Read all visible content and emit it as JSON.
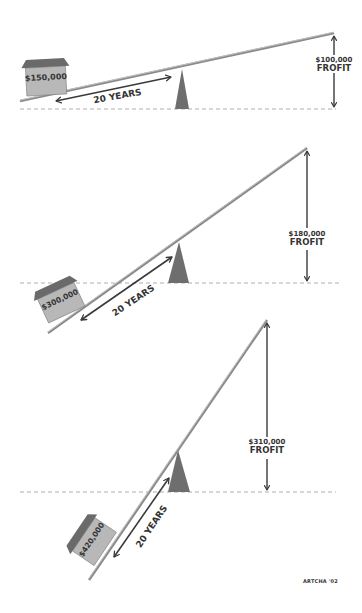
{
  "colors": {
    "beam": "#8a8a8a",
    "beam_highlight": "#d6d6d6",
    "fulcrum": "#6e6e6e",
    "house_wall": "#b8b8b8",
    "house_roof": "#6a6a6a",
    "arrow": "#3a3a3a",
    "ground": "#999999",
    "text": "#333333"
  },
  "panels": [
    {
      "house_value": "$150,000",
      "lever_label": "20 YEARS",
      "profit_value": "$100,000",
      "profit_label": "FROFIT"
    },
    {
      "house_value": "$300,000",
      "lever_label": "20 YEARS",
      "profit_value": "$180,000",
      "profit_label": "FROFIT"
    },
    {
      "house_value": "$420,000",
      "lever_label": "20 YEARS",
      "profit_value": "$310,000",
      "profit_label": "FROFIT"
    }
  ],
  "credit": "ARTCHA '02"
}
